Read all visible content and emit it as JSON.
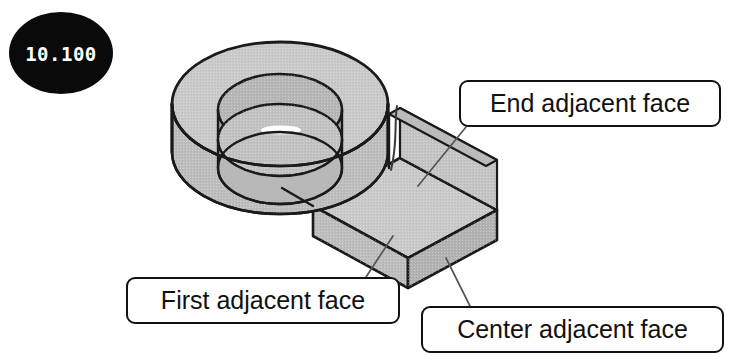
{
  "figure": {
    "badge_number": "10.100"
  },
  "callouts": [
    {
      "id": "end",
      "label": "End adjacent face"
    },
    {
      "id": "first",
      "label": "First adjacent face"
    },
    {
      "id": "center",
      "label": "Center adjacent face"
    }
  ],
  "colors": {
    "badge_fill": "#0a0a0a",
    "badge_text": "#ffffff",
    "outline": "#1a1a1a",
    "face_top": "#c9c9c9",
    "face_front": "#bdbdbd",
    "face_right": "#b2b2b2",
    "face_inner": "#a8a8a8",
    "leader": "#555555",
    "background": "#ffffff"
  }
}
